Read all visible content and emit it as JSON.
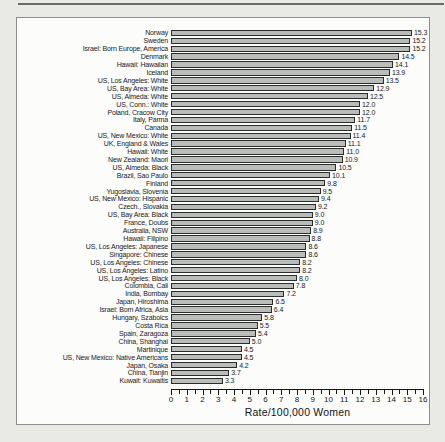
{
  "page": {
    "background_color": "#e9eae6",
    "panel_color": "#fcfcfb",
    "text_color": "#191919"
  },
  "chart_data": {
    "type": "bar",
    "orientation": "horizontal",
    "title": "",
    "xlabel": "Rate/100,000 Women",
    "ylabel": "",
    "xlim": [
      0,
      16
    ],
    "xticks": [
      0,
      1,
      2,
      3,
      4,
      5,
      6,
      7,
      8,
      9,
      10,
      11,
      12,
      13,
      14,
      15,
      16
    ],
    "minor_tick_interval": 0.5,
    "grid": false,
    "legend": false,
    "bar_color": "#b9bdb9",
    "bar_border_color": "#2c2c2c",
    "value_labels_shown": true,
    "categories": [
      "Norway",
      "Sweden",
      "Israel: Born Europe, America",
      "Denmark",
      "Hawaii: Hawaiian",
      "Iceland",
      "US, Los Angeles: White",
      "US, Bay Area: White",
      "US, Almeda: White",
      "US, Conn.: White",
      "Poland, Cracow City",
      "Italy, Parma",
      "Canada",
      "US, New Mexico: White",
      "UK, England & Wales",
      "Hawaii: White",
      "New Zealand: Maori",
      "US, Almeda: Black",
      "Brazil, Sao Paulo",
      "Finland",
      "Yugoslavia, Slovenia",
      "US, New Mexico: Hispanic",
      "Czech., Slovakia",
      "US, Bay Area: Black",
      "France, Doubs",
      "Australia, NSW",
      "Hawaii: Filipino",
      "US, Los Angeles: Japanese",
      "Singapore: Chinese",
      "US, Los Angeles: Chinese",
      "US, Los Angeles: Latino",
      "US, Los Angeles: Black",
      "Colombia, Cali",
      "India, Bombay",
      "Japan, Hiroshima",
      "Israel: Born Africa, Asia",
      "Hungary, Szabolcs",
      "Costa Rica",
      "Spain, Zaragoza",
      "China, Shanghai",
      "Martinique",
      "US, New Mexico: Native Americans",
      "Japan, Osaka",
      "China, Tianjin",
      "Kuwait: Kuwaitis"
    ],
    "values": [
      15.3,
      15.2,
      15.2,
      14.5,
      14.1,
      13.9,
      13.5,
      12.9,
      12.5,
      12.0,
      12.0,
      11.7,
      11.5,
      11.4,
      11.1,
      11.0,
      10.9,
      10.5,
      10.1,
      9.8,
      9.5,
      9.4,
      9.2,
      9.0,
      9.0,
      8.9,
      8.8,
      8.6,
      8.6,
      8.2,
      8.2,
      8.0,
      7.8,
      7.2,
      6.5,
      6.4,
      5.8,
      5.5,
      5.4,
      5.0,
      4.5,
      4.5,
      4.2,
      3.7,
      3.3
    ]
  }
}
